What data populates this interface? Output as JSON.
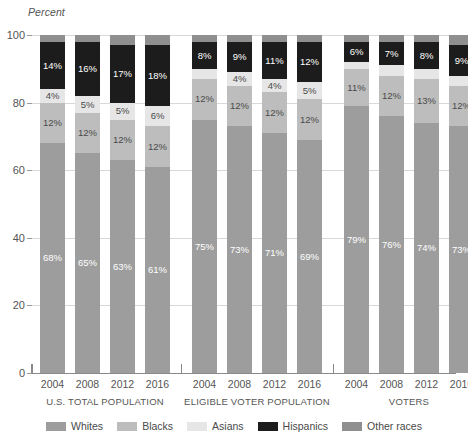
{
  "chart_data": {
    "type": "bar",
    "subtype": "stacked-bar-100",
    "title": "",
    "xlabel": "",
    "ylabel": "Percent",
    "ylim": [
      0,
      100
    ],
    "yticks": [
      0,
      20,
      40,
      60,
      80,
      100
    ],
    "grid": true,
    "legend_position": "bottom",
    "legend": [
      "Whites",
      "Blacks",
      "Asians",
      "Hispanics",
      "Other races"
    ],
    "series_colors": {
      "Whites": "#9d9d9d",
      "Blacks": "#bdbdbd",
      "Asians": "#e6e6e6",
      "Hispanics": "#1c1c1c",
      "Other races": "#8f8f8f"
    },
    "categories": [
      "2004",
      "2008",
      "2012",
      "2016"
    ],
    "groups": [
      {
        "name": "U.S. TOTAL POPULATION",
        "bars": [
          {
            "year": "2004",
            "Whites": 68,
            "Blacks": 12,
            "Asians": 4,
            "Hispanics": 14,
            "Other races": 2
          },
          {
            "year": "2008",
            "Whites": 65,
            "Blacks": 12,
            "Asians": 5,
            "Hispanics": 16,
            "Other races": 2
          },
          {
            "year": "2012",
            "Whites": 63,
            "Blacks": 12,
            "Asians": 5,
            "Hispanics": 17,
            "Other races": 3
          },
          {
            "year": "2016",
            "Whites": 61,
            "Blacks": 12,
            "Asians": 6,
            "Hispanics": 18,
            "Other races": 3
          }
        ]
      },
      {
        "name": "ELIGIBLE VOTER POPULATION",
        "bars": [
          {
            "year": "2004",
            "Whites": 75,
            "Blacks": 12,
            "Asians": 3,
            "Hispanics": 8,
            "Other races": 2
          },
          {
            "year": "2008",
            "Whites": 73,
            "Blacks": 12,
            "Asians": 4,
            "Hispanics": 9,
            "Other races": 2
          },
          {
            "year": "2012",
            "Whites": 71,
            "Blacks": 12,
            "Asians": 4,
            "Hispanics": 11,
            "Other races": 2
          },
          {
            "year": "2016",
            "Whites": 69,
            "Blacks": 12,
            "Asians": 5,
            "Hispanics": 12,
            "Other races": 2
          }
        ]
      },
      {
        "name": "VOTERS",
        "bars": [
          {
            "year": "2004",
            "Whites": 79,
            "Blacks": 11,
            "Asians": 2,
            "Hispanics": 6,
            "Other races": 2
          },
          {
            "year": "2008",
            "Whites": 76,
            "Blacks": 12,
            "Asians": 3,
            "Hispanics": 7,
            "Other races": 2
          },
          {
            "year": "2012",
            "Whites": 74,
            "Blacks": 13,
            "Asians": 3,
            "Hispanics": 8,
            "Other races": 2
          },
          {
            "year": "2016",
            "Whites": 73,
            "Blacks": 12,
            "Asians": 3,
            "Hispanics": 9,
            "Other races": 3
          }
        ]
      }
    ],
    "visible_labels": {
      "U.S. TOTAL POPULATION": {
        "2004": {
          "Whites": "68%",
          "Blacks": "12%",
          "Asians": "4%",
          "Hispanics": "14%"
        },
        "2008": {
          "Whites": "65%",
          "Blacks": "12%",
          "Asians": "5%",
          "Hispanics": "16%"
        },
        "2012": {
          "Whites": "63%",
          "Blacks": "12%",
          "Asians": "5%",
          "Hispanics": "17%"
        },
        "2016": {
          "Whites": "61%",
          "Blacks": "12%",
          "Asians": "6%",
          "Hispanics": "18%"
        }
      },
      "ELIGIBLE VOTER POPULATION": {
        "2004": {
          "Whites": "75%",
          "Blacks": "12%",
          "Asians": "",
          "Hispanics": "8%"
        },
        "2008": {
          "Whites": "73%",
          "Blacks": "12%",
          "Asians": "4%",
          "Hispanics": "9%"
        },
        "2012": {
          "Whites": "71%",
          "Blacks": "12%",
          "Asians": "4%",
          "Hispanics": "11%"
        },
        "2016": {
          "Whites": "69%",
          "Blacks": "12%",
          "Asians": "5%",
          "Hispanics": "12%"
        }
      },
      "VOTERS": {
        "2004": {
          "Whites": "79%",
          "Blacks": "11%",
          "Asians": "",
          "Hispanics": "6%"
        },
        "2008": {
          "Whites": "76%",
          "Blacks": "12%",
          "Asians": "",
          "Hispanics": "7%"
        },
        "2012": {
          "Whites": "74%",
          "Blacks": "13%",
          "Asians": "",
          "Hispanics": "8%"
        },
        "2016": {
          "Whites": "73%",
          "Blacks": "12%",
          "Asians": "",
          "Hispanics": "9%"
        }
      }
    }
  }
}
